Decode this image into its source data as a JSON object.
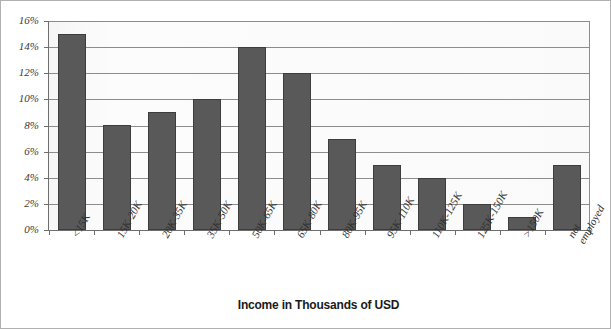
{
  "chart_data": {
    "type": "bar",
    "title": "",
    "xlabel": "Income in Thousands of USD",
    "ylabel": "",
    "categories": [
      "<15K",
      "15K-20K",
      "20K-35K",
      "35K-50K",
      "50K-65K",
      "65K-80K",
      "80K-95K",
      "95K-110K",
      "110K-125K",
      "125K-150K",
      ">150K",
      "not employed"
    ],
    "category_lines": [
      [
        "<15K"
      ],
      [
        "15K-20K"
      ],
      [
        "20K-35K"
      ],
      [
        "35K-50K"
      ],
      [
        "50K-65K"
      ],
      [
        "65K-80K"
      ],
      [
        "80K-95K"
      ],
      [
        "95K-110K"
      ],
      [
        "110K-125K"
      ],
      [
        "125K-150K"
      ],
      [
        ">150K"
      ],
      [
        "not",
        "employed"
      ]
    ],
    "values": [
      15,
      8,
      9,
      10,
      14,
      12,
      7,
      5,
      4,
      2,
      1,
      5
    ],
    "value_labels": [
      "15%",
      "8%",
      "9%",
      "10%",
      "14%",
      "12%",
      "7%",
      "5%",
      "4%",
      "2%",
      "1%",
      "5%"
    ],
    "ylim": [
      0,
      16
    ],
    "ytick_values": [
      0,
      2,
      4,
      6,
      8,
      10,
      12,
      14,
      16
    ],
    "ytick_labels": [
      "0%",
      "2%",
      "4%",
      "6%",
      "8%",
      "10%",
      "12%",
      "14%",
      "16%"
    ],
    "grid": true,
    "legend": "none",
    "colors": {
      "bar_fill": "#595959",
      "bar_border": "#3d3d3d",
      "gridline": "#8c8c8c",
      "axis_line": "#6e6e6e",
      "plot_background": "#fbfbfb",
      "frame_border": "#b0b0b0",
      "tick_label": "#3a3a3a",
      "axis_title": "#1a1a1a"
    }
  }
}
